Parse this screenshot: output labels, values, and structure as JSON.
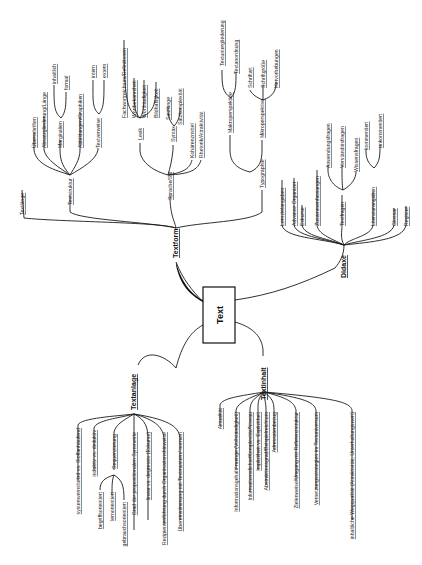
{
  "center": {
    "label": "Text"
  },
  "branches": {
    "textform": {
      "label": "Textform",
      "textlaenge": "Textlänge",
      "textstruktur": {
        "label": "Textstruktur",
        "items": [
          "Überschriften",
          "Absatzgliederung/Länge",
          "Marginalien",
          "Abbildungen/Graphiken",
          "Textverweise"
        ],
        "marginalien_sub": [
          "inhaltlich",
          "formal"
        ],
        "textverweise_sub": [
          "intern",
          "extern"
        ]
      },
      "sprache": {
        "label": "Sprache/Stil",
        "lexik": {
          "label": "Lexik",
          "items": [
            "Fachwortreichtum/Definitionen",
            "Wortbekanntheit",
            "Worthäufigkeit",
            "Bildhaftigkeit"
          ]
        },
        "syntax": {
          "label": "Syntax",
          "items": [
            "Satzlänge",
            "Satzkomplexität"
          ]
        },
        "items": [
          "Kohärenzmittel",
          "Rhetorik/Attraktivität"
        ]
      },
      "typographie": {
        "label": "Typographie",
        "makro": {
          "label": "Makroperspektive",
          "items": [
            "Textuntergliederung",
            "Textanordnung"
          ]
        },
        "mikro": {
          "label": "Mikroperspektive",
          "items": [
            "Schriftart",
            "Schriftgröße",
            "Hervorhebungen"
          ]
        }
      }
    },
    "didaxe": {
      "label": "Didaxe",
      "items": [
        "Lernzielangaben",
        "Advance Organizer",
        "Exkurse",
        "Zusammenfassungen"
      ],
      "textfragen": {
        "label": "Textfragen",
        "items": [
          "Anwendungsfragen",
          "Verständnisfragen",
          "Wissensfragen"
        ]
      },
      "literatur": {
        "label": "Literaturangaben",
        "items": [
          "kommentiert",
          "unkommentiert"
        ]
      },
      "tail": [
        "Glossar",
        "Register"
      ]
    },
    "textanlage": {
      "label": "Textanlage",
      "items": [
        "systemvermittelnd vs. Stoffanhäufend",
        "induktiv vs. deduktiv"
      ],
      "sequenzierung": {
        "label": "Sequenzierung",
        "items": [
          "begriffsorientiert",
          "lernorientiert",
          "gebrauchsorientiert"
        ]
      },
      "tail": [
        "Grad der propositionalen Symmetrie",
        "linear vs. degressiv (Exkurse)",
        "Rezipientenführung durch Organisationshinweise",
        "Übereinstimmung mit Textmustern/-normen"
      ]
    },
    "textinhalt": {
      "label": "Textinhalt",
      "items": [
        "Aktualität",
        "Informationsgehalt/-menge (Vollständigkeit)",
        "Informationsdichte/Komplexität/Niveau",
        "Implizitheit vs. Explizitheit",
        "Abstraktionsgrad/Beispielreichtum",
        "Adressatenbezug",
        "Zielenweise/Umgang mit Referenzstruktur",
        "Vernetzungsstrategien im Textuniversum",
        "inhaltliche Wegqualität (Attraktivität, Unterhaltungswert)"
      ]
    }
  }
}
